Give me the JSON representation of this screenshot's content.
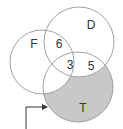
{
  "diagram": {
    "type": "venn",
    "sets": [
      {
        "id": "F",
        "label": "F",
        "cx": 42,
        "cy": 62,
        "r": 32
      },
      {
        "id": "D",
        "label": "D",
        "cx": 79,
        "cy": 42,
        "r": 35
      },
      {
        "id": "T",
        "label": "T",
        "cx": 78,
        "cy": 87,
        "r": 35
      }
    ],
    "region_values": {
      "F_and_D_only": "6",
      "F_and_D_and_T": "3",
      "D_and_T_only": "5"
    },
    "label_positions": {
      "F": {
        "x": 34,
        "y": 45
      },
      "D": {
        "x": 91,
        "y": 26
      },
      "T": {
        "x": 83,
        "y": 109
      },
      "six": {
        "x": 59,
        "y": 45
      },
      "three": {
        "x": 70,
        "y": 66
      },
      "five": {
        "x": 91,
        "y": 67
      }
    },
    "highlighted_region": "T only (not F, not D)",
    "highlight_color": "#c8c8c8",
    "outline_color": "#a0a0a0",
    "arrow": {
      "points": "26,129 26,107 44,107",
      "head_tip": [
        48,
        107
      ],
      "color": "#333333"
    }
  }
}
